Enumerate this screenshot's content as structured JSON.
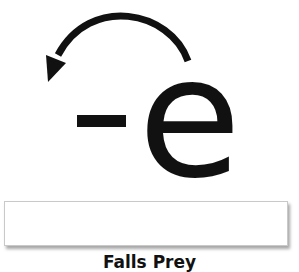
{
  "diagram": {
    "symbol_sign": "-",
    "symbol_letter": "e",
    "symbol_full": "-e (electron)",
    "arrow": {
      "icon": "curved-arrow-left-icon",
      "direction": "counterclockwise, from top of e to upper-left"
    },
    "colors": {
      "ink": "#111111",
      "background": "#ffffff",
      "box_border": "#c9c9c9"
    }
  },
  "answer_box": {
    "value": ""
  },
  "caption": {
    "text": "Falls Prey"
  }
}
